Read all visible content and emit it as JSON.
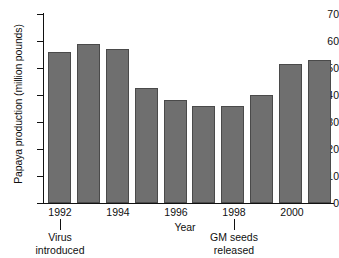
{
  "chart_data": {
    "type": "bar",
    "title": "",
    "xlabel": "Year",
    "ylabel": "Papaya production (million pounds)",
    "categories": [
      "1992",
      "1993",
      "1994",
      "1995",
      "1996",
      "1997",
      "1998",
      "1999",
      "2000",
      "2001"
    ],
    "tick_labels": [
      "1992",
      "1994",
      "1996",
      "1998",
      "2000"
    ],
    "values": [
      56,
      59,
      57,
      42.5,
      38,
      36,
      36,
      40,
      51.5,
      53
    ],
    "ylim": [
      0,
      70
    ],
    "yticks": [
      0,
      10,
      20,
      30,
      40,
      50,
      60,
      70
    ],
    "grid": false,
    "legend": null,
    "bar_color": "#6f6f6f",
    "bar_edge_color": "#4a4a4a",
    "axis_color": "#111111",
    "background_color": "#ffffff",
    "annotations": [
      {
        "text_line1": "Virus",
        "text_line2": "introduced",
        "at_category": "1992"
      },
      {
        "text_line1": "GM seeds",
        "text_line2": "released",
        "at_category": "1998"
      }
    ]
  },
  "axis": {
    "y_tick_0": "0",
    "y_tick_10": "10",
    "y_tick_20": "20",
    "y_tick_30": "30",
    "y_tick_40": "40",
    "y_tick_50": "50",
    "y_tick_60": "60",
    "y_tick_70": "70"
  },
  "xticks": {
    "t0": "1992",
    "t1": "1994",
    "t2": "1996",
    "t3": "1998",
    "t4": "2000"
  },
  "annotations": {
    "virus_l1": "Virus",
    "virus_l2": "introduced",
    "gm_l1": "GM seeds",
    "gm_l2": "released"
  },
  "labels": {
    "y_title": "Papaya production (million pounds)",
    "x_title": "Year"
  }
}
